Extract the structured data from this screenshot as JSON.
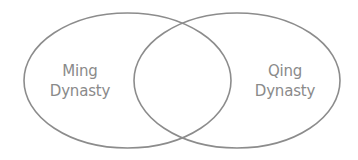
{
  "diagram": {
    "type": "venn",
    "colors": {
      "stroke": "#8c8c8c",
      "text": "#8a8a8a",
      "background": "#ffffff"
    },
    "sets": [
      {
        "id": "left",
        "label_line1": "Ming",
        "label_line2": "Dynasty",
        "ellipse": {
          "cx": 127.5,
          "cy": 80.5,
          "rx": 103.5,
          "ry": 67.5
        }
      },
      {
        "id": "right",
        "label_line1": "Qing",
        "label_line2": "Dynasty",
        "ellipse": {
          "cx": 237,
          "cy": 80.5,
          "rx": 103,
          "ry": 67.5
        }
      }
    ],
    "intersection_label": ""
  }
}
